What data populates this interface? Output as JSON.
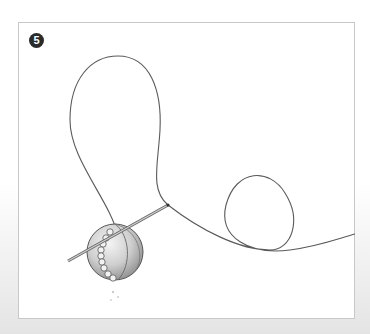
{
  "illustration": {
    "step_number": "5",
    "subject": "threaded needle through beaded ball with looping thread",
    "colors": {
      "thread": "#555555",
      "ball_light": "#e8e8e8",
      "ball_dark": "#9a9a9a",
      "frame_border": "#c8c8c8",
      "badge": "#2a2a2a"
    }
  }
}
